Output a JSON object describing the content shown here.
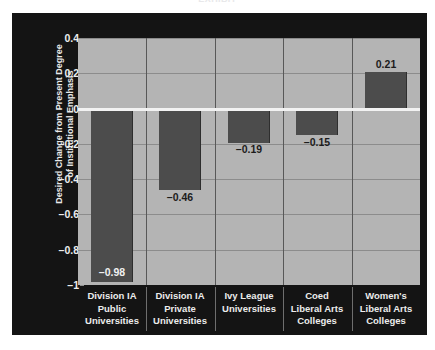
{
  "figure": {
    "clipped_title": "EXHIBIT",
    "panel_bg": "#141414",
    "plot_bg": "#b4b4b4",
    "bar_color": "#4c4c4c",
    "zero_line_color": "#f2f2f2",
    "grid_color": "#8c8c8c",
    "text_color": "#ececec"
  },
  "chart_data": {
    "type": "bar",
    "title": "",
    "xlabel": "",
    "ylabel": "Desired Change from Present Degree of Institutional Emphasis",
    "ylabel_lines": [
      "Desired Change from Present Degree",
      "of Institutional Emphasis"
    ],
    "categories": [
      "Division IA Public Universities",
      "Division IA Private Universities",
      "Ivy League Universities",
      "Coed Liberal Arts Colleges",
      "Women's Liberal Arts Colleges"
    ],
    "category_lines": [
      [
        "Division IA",
        "Public",
        "Universities"
      ],
      [
        "Division IA",
        "Private",
        "Universities"
      ],
      [
        "Ivy League",
        "Universities"
      ],
      [
        "Coed",
        "Liberal Arts",
        "Colleges"
      ],
      [
        "Women's",
        "Liberal Arts",
        "Colleges"
      ]
    ],
    "values": [
      -0.98,
      -0.46,
      -0.19,
      -0.15,
      0.21
    ],
    "value_labels": [
      "–0.98",
      "–0.46",
      "–0.19",
      "–0.15",
      "0.21"
    ],
    "label_placement": [
      "inside",
      "outside",
      "outside",
      "outside",
      "outside"
    ],
    "ylim": [
      -1,
      0.4
    ],
    "yticks": [
      0.4,
      0.2,
      0,
      -0.2,
      -0.4,
      -0.6,
      -0.8,
      -1
    ],
    "ytick_labels": [
      "0.4",
      "0.2",
      "0",
      "–0.2",
      "–0.4",
      "–0.6",
      "–0.8",
      "–1"
    ],
    "grid": "horizontal-and-category-separators",
    "legend": "none"
  }
}
